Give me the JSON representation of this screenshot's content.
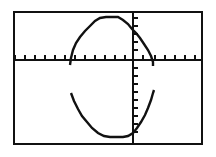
{
  "screen": {
    "kind": "graphing-calculator-screen",
    "width": 216,
    "height": 157,
    "background_color": "#ffffff",
    "frame_color": "#111111",
    "ink_color": "#111111"
  },
  "chart_data": {
    "type": "line",
    "title": "",
    "subtitle": "",
    "xlabel": "",
    "ylabel": "",
    "legend": [],
    "annotations": [],
    "grid": false,
    "legend_position": "none",
    "axes": {
      "x_axis": {
        "visible": true,
        "pixel_y": 60,
        "pixel_x_start": 15,
        "pixel_x_end": 201,
        "tick_count": 19,
        "tick_spacing_px": 10,
        "tick_length_px": 5,
        "tick_direction": "up"
      },
      "y_axis": {
        "visible": true,
        "pixel_x": 133,
        "pixel_y_start": 13,
        "pixel_y_end": 143,
        "tick_count": 13,
        "tick_spacing_px": 10,
        "tick_length_px": 5,
        "tick_direction": "right"
      },
      "origin_px": [
        133,
        60
      ],
      "xlim": [
        -11.8,
        6.8
      ],
      "ylim": [
        -8.3,
        4.7
      ]
    },
    "series": [
      {
        "name": "upper-arch",
        "kind": "polyline",
        "color": "#111111",
        "points_px": [
          [
            70,
            65
          ],
          [
            71,
            58
          ],
          [
            73,
            50
          ],
          [
            76,
            43
          ],
          [
            80,
            37
          ],
          [
            85,
            31
          ],
          [
            90,
            26
          ],
          [
            95,
            21
          ],
          [
            100,
            18
          ],
          [
            106,
            17
          ],
          [
            112,
            17
          ],
          [
            118,
            17
          ],
          [
            123,
            20
          ],
          [
            128,
            24
          ],
          [
            132,
            29
          ],
          [
            136,
            33
          ],
          [
            140,
            38
          ],
          [
            144,
            44
          ],
          [
            148,
            50
          ],
          [
            151,
            56
          ],
          [
            153,
            62
          ],
          [
            153,
            66
          ]
        ]
      },
      {
        "name": "lower-valley",
        "kind": "polyline",
        "color": "#111111",
        "points_px": [
          [
            71,
            93
          ],
          [
            74,
            101
          ],
          [
            78,
            109
          ],
          [
            82,
            116
          ],
          [
            87,
            122
          ],
          [
            92,
            128
          ],
          [
            98,
            133
          ],
          [
            104,
            136
          ],
          [
            110,
            137
          ],
          [
            117,
            137
          ],
          [
            123,
            137
          ],
          [
            128,
            136
          ],
          [
            133,
            133
          ],
          [
            137,
            128
          ],
          [
            141,
            122
          ],
          [
            145,
            115
          ],
          [
            148,
            108
          ],
          [
            151,
            100
          ],
          [
            153,
            93
          ],
          [
            154,
            90
          ]
        ]
      }
    ],
    "x_tick_positions_px": [
      15,
      25,
      35,
      45,
      55,
      65,
      75,
      85,
      95,
      105,
      115,
      125,
      135,
      145,
      155,
      165,
      175,
      185,
      195
    ],
    "y_tick_positions_px": [
      18,
      26,
      34,
      42,
      50,
      68,
      76,
      84,
      92,
      100,
      108,
      116,
      124,
      132,
      140
    ]
  }
}
